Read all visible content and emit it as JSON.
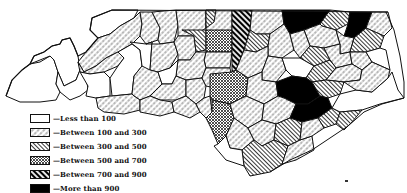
{
  "map": {
    "title": "North Carolina counties choropleth",
    "region": "North Carolina"
  },
  "legend": {
    "items": [
      {
        "label": "—Less than 100",
        "pattern": "blank"
      },
      {
        "label": "—Between 100 and 300",
        "pattern": "dotted-diagonal"
      },
      {
        "label": "—Between 300 and 500",
        "pattern": "fine-diagonal"
      },
      {
        "label": "—Between 500 and 700",
        "pattern": "crosshatch"
      },
      {
        "label": "—Between 700 and 900",
        "pattern": "heavy-diagonal"
      },
      {
        "label": "—More than 900",
        "pattern": "solid-black"
      }
    ]
  },
  "colors": {
    "ink": "#111111",
    "paper": "#ffffff"
  }
}
